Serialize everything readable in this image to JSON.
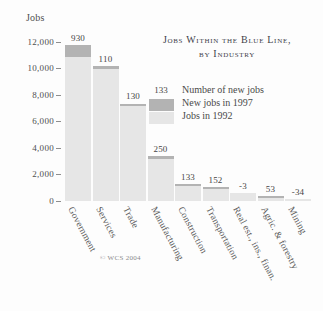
{
  "chart_data": {
    "type": "bar",
    "title": "Jobs Within the Blue Line, by Industry",
    "title_line1": "Jobs Within the Blue Line,",
    "title_line2": "by Industry",
    "xlabel": "",
    "ylabel": "Jobs",
    "ylim": [
      0,
      12000
    ],
    "grid": false,
    "legend_position": "upper-right-inside",
    "categories": [
      "Government",
      "Services",
      "Trade",
      "Manufacturing",
      "Construction",
      "Transportation",
      "Real est., ins., finan.",
      "Agric. & forestry",
      "Mining"
    ],
    "series": [
      {
        "name": "Jobs in 1992",
        "color": "#e6e6e6",
        "values": [
          10850,
          10000,
          7170,
          3150,
          1120,
          880,
          630,
          210,
          160
        ]
      },
      {
        "name": "New jobs in 1997",
        "color": "#b3b3b3",
        "values": [
          930,
          110,
          130,
          250,
          133,
          152,
          -3,
          53,
          -34
        ]
      }
    ],
    "totals": [
      11780,
      10110,
      7300,
      3400,
      1253,
      1032,
      627,
      263,
      126
    ],
    "data_labels": [
      "930",
      "110",
      "130",
      "250",
      "133",
      "152",
      "-3",
      "53",
      "-34"
    ],
    "ticks": [
      {
        "value": 12000,
        "label": "12,000"
      },
      {
        "value": 10000,
        "label": "10,000"
      },
      {
        "value": 8000,
        "label": "8,000"
      },
      {
        "value": 6000,
        "label": "6,000"
      },
      {
        "value": 4000,
        "label": "4,000"
      },
      {
        "value": 2000,
        "label": "2,000"
      },
      {
        "value": 0,
        "label": "0"
      }
    ],
    "legend": {
      "value_sample": "133",
      "value_caption": "Number of new jobs",
      "new_jobs_label": "New jobs in 1997",
      "old_jobs_label": "Jobs in 1992"
    },
    "credit": "© WCS 2004"
  }
}
